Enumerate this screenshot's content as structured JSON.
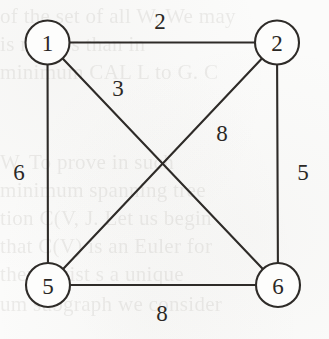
{
  "figure": {
    "kind": "weighted-undirected-graph",
    "background_color": "#fbfbfa",
    "ink_color": "#2e2b28",
    "node_fill_color": "#fdfdfc"
  },
  "graph": {
    "nodes": [
      {
        "id": "1",
        "label": "1",
        "cx": 47.5,
        "cy": 42.5,
        "r": 22
      },
      {
        "id": "2",
        "label": "2",
        "cx": 277.0,
        "cy": 42.5,
        "r": 22
      },
      {
        "id": "5",
        "label": "5",
        "cx": 48.0,
        "cy": 285.0,
        "r": 22
      },
      {
        "id": "6",
        "label": "6",
        "cx": 278.0,
        "cy": 285.0,
        "r": 22
      }
    ],
    "edges": [
      {
        "id": "e12",
        "from": "1",
        "to": "2",
        "weight": "2",
        "label_x": 160,
        "label_y": 21
      },
      {
        "id": "e15",
        "from": "1",
        "to": "5",
        "weight": "6",
        "label_x": 19,
        "label_y": 172
      },
      {
        "id": "e16",
        "from": "1",
        "to": "6",
        "weight": "3",
        "label_x": 118,
        "label_y": 88
      },
      {
        "id": "e25",
        "from": "2",
        "to": "5",
        "weight": "8",
        "label_x": 222,
        "label_y": 133
      },
      {
        "id": "e26",
        "from": "2",
        "to": "6",
        "weight": "5",
        "label_x": 303,
        "label_y": 172
      },
      {
        "id": "e56",
        "from": "5",
        "to": "6",
        "weight": "8",
        "label_x": 162,
        "label_y": 313
      }
    ],
    "crossing_point": {
      "x": 162,
      "y": 163
    }
  },
  "background_ghost_text": {
    "note": "faint show-through of printed text from the reverse page",
    "lines": [
      {
        "text": "of the set of all W. We may",
        "x": 0,
        "y": 4
      },
      {
        "text": "is no less than in",
        "x": 0,
        "y": 32
      },
      {
        "text": "minimum CAL L to G. C",
        "x": 0,
        "y": 60
      },
      {
        "text": "W. To prove in such",
        "x": 0,
        "y": 150
      },
      {
        "text": "minimum spanning tree",
        "x": 0,
        "y": 178
      },
      {
        "text": "tion C(V, J. Let us begin",
        "x": 0,
        "y": 206
      },
      {
        "text": "that C(V) is an Euler for",
        "x": 0,
        "y": 234
      },
      {
        "text": "there exist s a unique",
        "x": 0,
        "y": 262
      },
      {
        "text": "um subgraph we consider",
        "x": 0,
        "y": 292
      }
    ]
  }
}
